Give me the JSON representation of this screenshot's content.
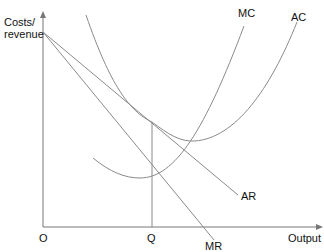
{
  "diagram": {
    "y_axis_label_line1": "Costs/",
    "y_axis_label_line2": "revenue",
    "x_axis_label": "Output",
    "origin_label": "O",
    "quantity_label": "Q",
    "curves": {
      "mc": "MC",
      "ac": "AC",
      "ar": "AR",
      "mr": "MR"
    },
    "line_color": "#8a8a8a",
    "text_color": "#111111"
  }
}
